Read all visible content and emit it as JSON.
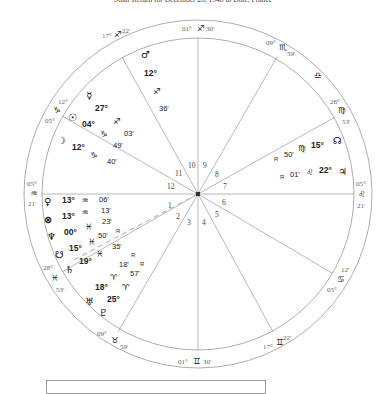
{
  "title": "Solar Return for December 26, 1948 in Dole, France",
  "colors": {
    "line": "#999999",
    "text": "#222222",
    "aspect_dash": "#bbbbbb"
  },
  "center": {
    "x": 198,
    "y": 194
  },
  "cusps": [
    {
      "id": "mc",
      "deg": "01°",
      "sign": "♐",
      "min": "30'"
    },
    {
      "id": "c11",
      "deg": "17°",
      "sign": "♐",
      "min": "22'"
    },
    {
      "id": "c12",
      "deg": "12°",
      "sign": "♑",
      "min": "05°"
    },
    {
      "id": "asc",
      "deg": "05°",
      "sign": "♒",
      "min": "21'"
    },
    {
      "id": "c2",
      "deg": "28°",
      "sign": "♓",
      "min": "53'"
    },
    {
      "id": "c3",
      "deg": "09°",
      "sign": "♉",
      "min": "59'"
    },
    {
      "id": "ic",
      "deg": "01°",
      "sign": "♊",
      "min": "30'"
    },
    {
      "id": "c5",
      "deg": "17°",
      "sign": "♊",
      "min": "22'"
    },
    {
      "id": "c6",
      "deg": "12'",
      "sign": "♋",
      "min": "05°"
    },
    {
      "id": "dsc",
      "deg": "05°",
      "sign": "♌",
      "min": "21'"
    },
    {
      "id": "c8",
      "deg": "28°",
      "sign": "♍",
      "min": "53'"
    },
    {
      "id": "c9",
      "deg": "09°",
      "sign": "♏",
      "min": "59'"
    },
    {
      "id": "intercept",
      "sign": "♎"
    }
  ],
  "houses": [
    "1",
    "2",
    "3",
    "4",
    "5",
    "6",
    "7",
    "8",
    "9",
    "10",
    "11",
    "12"
  ],
  "planets": {
    "mars": {
      "glyph": "♂",
      "deg": "12°",
      "sign": "♐",
      "min": "36'"
    },
    "mercury": {
      "glyph": "☿",
      "deg": "27°",
      "sign": "♐",
      "min": "03'"
    },
    "sun": {
      "glyph": "☉",
      "deg": "04°",
      "sign": "♑",
      "min": "49'"
    },
    "moon": {
      "glyph": "☽",
      "deg": "12°",
      "sign": "♑",
      "min": "40'"
    },
    "venus": {
      "glyph": "♀",
      "deg": "13°",
      "sign": "♒",
      "min": "06'"
    },
    "fortune": {
      "glyph": "⊗",
      "deg": "13°",
      "sign": "♒",
      "min": "13'"
    },
    "neptune": {
      "glyph": "♆",
      "deg": "00°",
      "sign": "♓",
      "min": "23'"
    },
    "south_node": {
      "glyph": "☋",
      "deg": "15°",
      "sign": "♓",
      "min": "50'",
      "retro": "R"
    },
    "saturn": {
      "glyph": "♄",
      "deg": "19°",
      "sign": "♓",
      "min": "35'"
    },
    "uranus": {
      "glyph": "♅",
      "deg": "18°",
      "sign": "♈",
      "min": "18'",
      "retro": "R"
    },
    "pluto": {
      "glyph": "♇",
      "deg": "25°",
      "sign": "♈",
      "min": "57'",
      "retro": "R"
    },
    "north_node": {
      "glyph": "☊",
      "deg": "15°",
      "sign": "♍",
      "min": "50'",
      "retro": "R"
    },
    "jupiter": {
      "glyph": "♃",
      "deg": "22°",
      "sign": "♌",
      "min": "01'",
      "retro": "R"
    }
  }
}
